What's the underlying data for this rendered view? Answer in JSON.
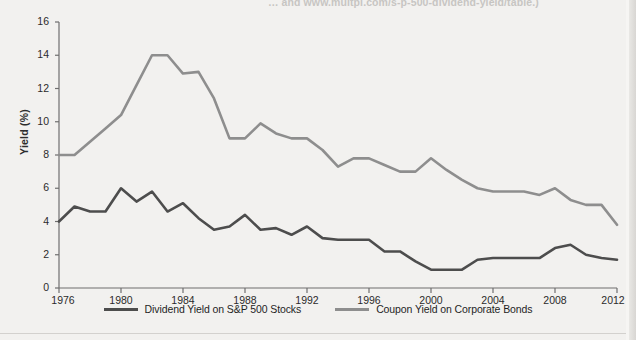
{
  "caption": {
    "text": "… and www.multpl.com/s-p-500-dividend-yield/table.)"
  },
  "axes": {
    "ylabel": "Yield (%)",
    "yticks": [
      0,
      2,
      4,
      6,
      8,
      10,
      12,
      14,
      16
    ],
    "xticks": [
      1976,
      1980,
      1984,
      1988,
      1992,
      1996,
      2000,
      2004,
      2008,
      2012
    ]
  },
  "legend": {
    "items": [
      {
        "label": "Dividend Yield on S&P 500 Stocks",
        "color": "#4d4d4d"
      },
      {
        "label": "Coupon Yield on Corporate Bonds",
        "color": "#8e8e8e"
      }
    ]
  },
  "chart_data": {
    "type": "line",
    "title": "",
    "xlabel": "",
    "ylabel": "Yield (%)",
    "xlim": [
      1976,
      2012
    ],
    "ylim": [
      0,
      16
    ],
    "grid": false,
    "legend_position": "bottom-center",
    "x": [
      1976,
      1977,
      1978,
      1979,
      1980,
      1981,
      1982,
      1983,
      1984,
      1985,
      1986,
      1987,
      1988,
      1989,
      1990,
      1991,
      1992,
      1993,
      1994,
      1995,
      1996,
      1997,
      1998,
      1999,
      2000,
      2001,
      2002,
      2003,
      2004,
      2005,
      2006,
      2007,
      2008,
      2009,
      2010,
      2011,
      2012
    ],
    "series": [
      {
        "name": "Coupon Yield on Corporate Bonds",
        "color": "#8e8e8e",
        "values": [
          8.0,
          8.0,
          8.8,
          9.6,
          10.4,
          12.2,
          14.0,
          14.0,
          12.9,
          13.0,
          11.4,
          9.0,
          9.0,
          9.9,
          9.3,
          9.0,
          9.0,
          8.3,
          7.3,
          7.8,
          7.8,
          7.4,
          7.0,
          7.0,
          7.8,
          7.1,
          6.5,
          6.0,
          5.8,
          5.8,
          5.8,
          5.6,
          6.0,
          5.3,
          5.0,
          5.0,
          3.8
        ]
      },
      {
        "name": "Dividend Yield on S&P 500 Stocks",
        "color": "#4d4d4d",
        "values": [
          4.0,
          4.9,
          4.6,
          4.6,
          6.0,
          5.2,
          5.8,
          4.6,
          5.1,
          4.2,
          3.5,
          3.7,
          4.4,
          3.5,
          3.6,
          3.2,
          3.7,
          3.0,
          2.9,
          2.9,
          2.9,
          2.2,
          2.2,
          1.6,
          1.1,
          1.1,
          1.1,
          1.7,
          1.8,
          1.8,
          1.8,
          1.8,
          2.4,
          2.6,
          2.0,
          1.8,
          1.7
        ]
      }
    ]
  }
}
